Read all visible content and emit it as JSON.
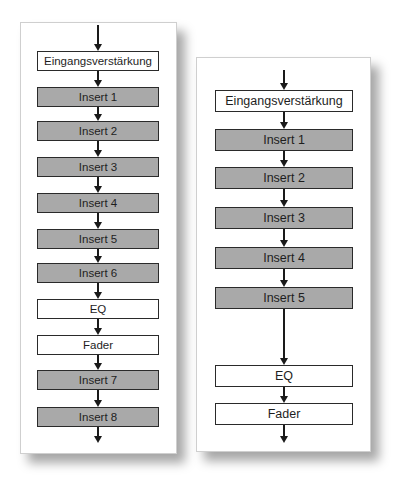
{
  "diagrams": [
    {
      "id": "left",
      "title": "",
      "stages": [
        {
          "label": "Eingangsverstärkung",
          "style": "white"
        },
        {
          "label": "Insert 1",
          "style": "grey"
        },
        {
          "label": "Insert 2",
          "style": "grey"
        },
        {
          "label": "Insert 3",
          "style": "grey"
        },
        {
          "label": "Insert 4",
          "style": "grey"
        },
        {
          "label": "Insert 5",
          "style": "grey"
        },
        {
          "label": "Insert 6",
          "style": "grey"
        },
        {
          "label": "EQ",
          "style": "white"
        },
        {
          "label": "Fader",
          "style": "white"
        },
        {
          "label": "Insert 7",
          "style": "grey"
        },
        {
          "label": "Insert 8",
          "style": "grey"
        }
      ],
      "flow": "top-to-bottom",
      "input_arrow": true,
      "output_arrow": true
    },
    {
      "id": "right",
      "title": "",
      "stages": [
        {
          "label": "Eingangsverstärkung",
          "style": "white"
        },
        {
          "label": "Insert 1",
          "style": "grey"
        },
        {
          "label": "Insert 2",
          "style": "grey"
        },
        {
          "label": "Insert 3",
          "style": "grey"
        },
        {
          "label": "Insert 4",
          "style": "grey"
        },
        {
          "label": "Insert 5",
          "style": "grey"
        },
        {
          "label": "EQ",
          "style": "white"
        },
        {
          "label": "Fader",
          "style": "white"
        }
      ],
      "flow": "top-to-bottom",
      "input_arrow": true,
      "output_arrow": true
    }
  ],
  "colors": {
    "insert_fill": "#a9a9a9",
    "stage_fill": "#ffffff",
    "border": "#2a2a2a",
    "arrow": "#1a1a1a"
  }
}
